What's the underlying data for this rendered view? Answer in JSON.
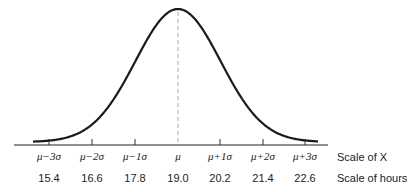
{
  "chart_data": {
    "type": "line",
    "title": "",
    "x_labels_sigma": [
      "μ−3σ",
      "μ−2σ",
      "μ−1σ",
      "μ",
      "μ+1σ",
      "μ+2σ",
      "μ+3σ"
    ],
    "x_labels_hours": [
      "15.4",
      "16.6",
      "17.8",
      "19.0",
      "20.2",
      "21.4",
      "22.6"
    ],
    "mean": 19.0,
    "std_dev": 1.2,
    "scale_labels": [
      "Scale of X",
      "Scale of hours"
    ],
    "mean_line": "dashed",
    "grid": false
  },
  "axis": {
    "sigma_labels": [
      "μ−3σ",
      "μ−2σ",
      "μ−1σ",
      "μ",
      "μ+1σ",
      "μ+2σ",
      "μ+3σ"
    ],
    "hour_labels": [
      "15.4",
      "16.6",
      "17.8",
      "19.0",
      "20.2",
      "21.4",
      "22.6"
    ],
    "scale_x_label": "Scale of X",
    "scale_hours_label": "Scale of hours"
  }
}
